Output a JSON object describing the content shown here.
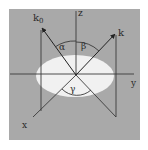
{
  "diagram": {
    "colors": {
      "background": "#ffffff",
      "panel": "#a9a9a9",
      "surface": "#f1f1f1",
      "line": "#3a3a3a"
    },
    "labels": {
      "incident_vector": "k",
      "incident_subscript": "0",
      "scattered_vector": "k",
      "axis_z": "z",
      "axis_y": "y",
      "axis_x": "x",
      "angle_incident": "α",
      "angle_scattered": "β",
      "angle_azimuth": "γ"
    }
  }
}
